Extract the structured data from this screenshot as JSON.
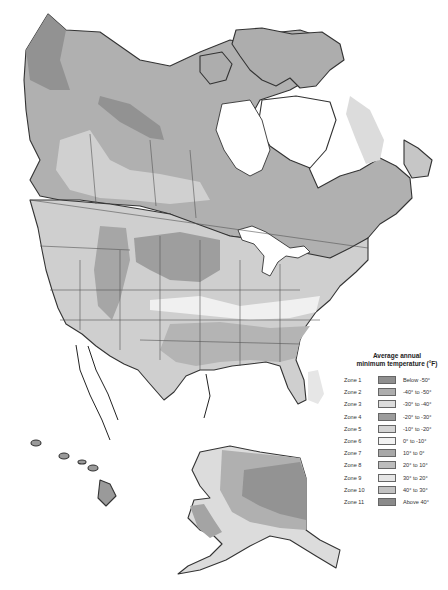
{
  "map": {
    "title": "Plant hardiness zones of North America",
    "regions_shown": [
      "Canada",
      "United States",
      "Alaska",
      "Hawaii",
      "Greenland",
      "Northern Mexico"
    ]
  },
  "legend": {
    "title_line1": "Average annual",
    "title_line2": "minimum temperature (°F)",
    "zones": [
      {
        "zone": "Zone 1",
        "range": "Below -50°",
        "color": "#8f8f8f"
      },
      {
        "zone": "Zone 2",
        "range": "-40° to -50°",
        "color": "#adadad"
      },
      {
        "zone": "Zone 3",
        "range": "-30° to -40°",
        "color": "#dcdcdc"
      },
      {
        "zone": "Zone 4",
        "range": "-20° to -30°",
        "color": "#9c9c9c"
      },
      {
        "zone": "Zone 5",
        "range": "-10° to -20°",
        "color": "#d4d4d4"
      },
      {
        "zone": "Zone 6",
        "range": "0° to -10°",
        "color": "#f2f2f2"
      },
      {
        "zone": "Zone 7",
        "range": "10° to 0°",
        "color": "#a8a8a8"
      },
      {
        "zone": "Zone 8",
        "range": "20° to 10°",
        "color": "#bdbdbd"
      },
      {
        "zone": "Zone 9",
        "range": "30° to 20°",
        "color": "#e6e6e6"
      },
      {
        "zone": "Zone 10",
        "range": "40° to 30°",
        "color": "#c2c2c2"
      },
      {
        "zone": "Zone 11",
        "range": "Above 40°",
        "color": "#8a8a8a"
      }
    ]
  }
}
